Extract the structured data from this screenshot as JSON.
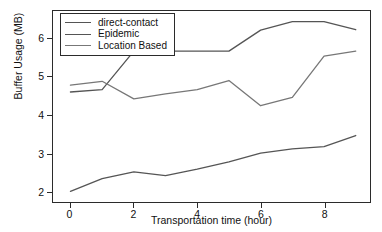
{
  "chart_data": {
    "type": "line",
    "title": "",
    "xlabel": "Transportation time (hour)",
    "ylabel": "Buffer Usage (MB)",
    "x": [
      0,
      1,
      2,
      3,
      4,
      5,
      6,
      7,
      8,
      9
    ],
    "xlim": [
      -0.55,
      9.45
    ],
    "ylim": [
      1.72,
      6.72
    ],
    "xticks": [
      0,
      2,
      4,
      6,
      8
    ],
    "yticks": [
      2,
      3,
      4,
      5,
      6
    ],
    "xticklabels": [
      "0",
      "2",
      "4",
      "6",
      "8"
    ],
    "yticklabels": [
      "2",
      "3",
      "4",
      "5",
      "6"
    ],
    "grid": false,
    "legend_position": "upper left",
    "series": [
      {
        "name": "direct-contact",
        "color": "#555555",
        "values": [
          2.0,
          2.33,
          2.51,
          2.41,
          2.58,
          2.77,
          3.0,
          3.11,
          3.17,
          3.46
        ]
      },
      {
        "name": "Epidemic",
        "color": "#555555",
        "values": [
          4.6,
          4.66,
          5.67,
          5.67,
          5.67,
          5.67,
          6.22,
          6.44,
          6.44,
          6.23
        ]
      },
      {
        "name": "Location Based",
        "color": "#777777",
        "values": [
          4.78,
          4.88,
          4.42,
          4.55,
          4.66,
          4.9,
          4.24,
          4.46,
          5.54,
          5.67
        ]
      }
    ]
  },
  "colors": {
    "axis": "#2b2b2b",
    "text": "#111111",
    "background": "#ffffff"
  }
}
